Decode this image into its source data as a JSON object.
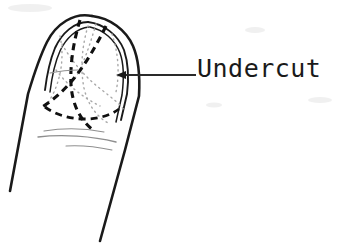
{
  "figure": {
    "kind": "hand-drawn-sketch",
    "background_color": "#ffffff",
    "ink_color": "#1a1a1a",
    "faint_ink_color": "#9a9a9a",
    "width": 350,
    "height": 245
  },
  "annotation": {
    "label": "Undercut",
    "label_color": "#1a1a1a",
    "label_x": 197,
    "label_y": 55,
    "leader": {
      "type": "arrow",
      "direction": "left",
      "tail_x": 196,
      "tail_y": 75,
      "head_x": 118,
      "head_y": 75
    }
  },
  "drawing": {
    "finger_outline_name": "finger-outline",
    "nail_outline_name": "fingernail-outline",
    "undercut_curves_name": "undercut-dashed-curves",
    "crease_lines_name": "knuckle-crease-lines",
    "strokes": {
      "finger_left_edge": "M 92 16 C 74 12, 56 24, 47 42 C 40 56, 34 74, 28 94 L 10 191",
      "finger_right_edge": "M 92 16 C 110 18, 126 30, 133 46 C 139 60, 140 78, 139 96 L 125 150 L 100 241",
      "nail_left_outer": "M 88 22 C 74 22, 62 33, 55 48 C 50 60, 47 74, 45 90",
      "nail_left_inner": "M 89 27 C 77 28, 66 38, 60 51 C 55 62, 52 76, 50 92",
      "nail_right_outer": "M 88 22 C 104 24, 118 35, 124 50 C 128 62, 129 78, 127 94 L 121 120",
      "nail_right_inner": "M 90 27 C 104 30, 115 40, 120 53 C 124 64, 124 79, 122 95 L 116 122",
      "nail_base_dash": "M 45 108 C 55 116, 70 120, 86 120 C 100 120, 112 116, 120 110",
      "undercut_dash_main": "M 80 20 C 74 40, 70 62, 71 84 C 72 104, 80 120, 93 130",
      "undercut_dash_second": "M 106 26 C 96 44, 86 62, 74 78 C 64 92, 52 102, 42 108",
      "undercut_dot_a": "M 88 26 C 82 46, 80 68, 84 88 C 88 106, 98 118, 110 124",
      "undercut_dot_b": "M 96 24 C 90 44, 84 64, 74 80",
      "undercut_dot_c": "M 62 44 C 72 62, 86 78, 102 90 C 112 98, 120 104, 124 110",
      "undercut_dot_d": "M 56 70 C 68 86, 84 98, 100 106",
      "crease_1": "M 44 131 C 62 128, 84 128, 104 132",
      "crease_2": "M 38 137 C 62 134, 92 136, 116 142",
      "crease_3": "M 66 146 C 82 145, 98 147, 112 150",
      "nail_highlight": "M 50 73 C 60 71, 70 70, 78 70"
    }
  }
}
